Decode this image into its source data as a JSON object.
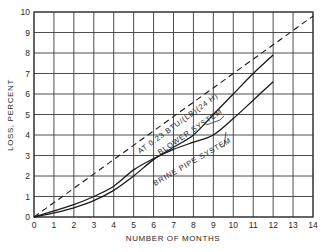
{
  "chart_data": {
    "type": "line",
    "title": "",
    "xlabel": "NUMBER OF MONTHS",
    "ylabel": "LOSS, PERCENT",
    "xlim": [
      0,
      14
    ],
    "ylim": [
      0,
      10
    ],
    "grid": true,
    "x_ticks": [
      "0",
      "1",
      "2",
      "3",
      "4",
      "5",
      "6",
      "7",
      "8",
      "9",
      "10",
      "11",
      "12",
      "13",
      "14"
    ],
    "y_ticks": [
      "0",
      "1",
      "2",
      "3",
      "4",
      "5",
      "6",
      "7",
      "8",
      "9",
      "10"
    ],
    "series": [
      {
        "name": "AT 0.23 BTU/(LB)(24 H)",
        "style": "dashed",
        "x": [
          0,
          14
        ],
        "y": [
          0,
          9.8
        ]
      },
      {
        "name": "BLOWER SYSTEM",
        "style": "solid",
        "x": [
          0,
          1,
          2,
          3,
          4,
          5,
          6,
          7,
          8,
          9,
          10,
          11,
          12
        ],
        "y": [
          0,
          0.2,
          0.45,
          0.8,
          1.3,
          2.0,
          2.8,
          3.4,
          4.0,
          5.0,
          6.0,
          7.0,
          7.9
        ]
      },
      {
        "name": "BRINE PIPE SYSTEM",
        "style": "solid",
        "x": [
          0,
          1,
          2,
          3,
          4,
          5,
          6,
          7,
          8,
          9,
          10,
          11,
          12
        ],
        "y": [
          0,
          0.3,
          0.6,
          1.0,
          1.5,
          2.3,
          2.85,
          3.3,
          3.65,
          4.0,
          4.8,
          5.7,
          6.6
        ]
      }
    ],
    "annotations": [
      {
        "text": "AT 0.23 BTU/(LB)(24 H)",
        "target": "dashed line"
      },
      {
        "text": "BLOWER SYSTEM",
        "target": "upper solid curve (after crossing ~6 months)"
      },
      {
        "text": "BRINE PIPE SYSTEM",
        "target": "lower solid curve (after crossing ~6 months)"
      }
    ]
  },
  "labels": {
    "xlabel": "NUMBER OF MONTHS",
    "ylabel": "LOSS, PERCENT",
    "dashed_label": "AT 0.23 BTU/(LB)(24 H)",
    "blower_label": "BLOWER SYSTEM",
    "brine_label": "BRINE PIPE SYSTEM"
  }
}
